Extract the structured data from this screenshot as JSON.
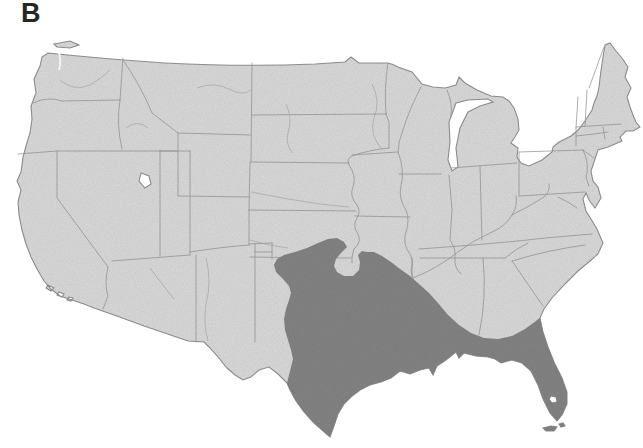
{
  "figure": {
    "panel_label": "B"
  },
  "map": {
    "description": "Outline map of the contiguous United States with state borders. A dark gray shaded range covers the south-central and southeastern states: eastern and southern Texas, eastern Oklahoma, Arkansas, Louisiana, Mississippi, Alabama, southern Georgia and all of Florida, reaching the Atlantic coast near the Georgia/South Carolina border, with a small unshaded notch pocket near the Oklahoma/Missouri/Arkansas corner.",
    "colors": {
      "background": "#ffffff",
      "land": "#dcdcdc",
      "state_border": "#9b9b9b",
      "coast_border": "#8f8f8f",
      "range": "#858585",
      "label": "#262626"
    }
  }
}
